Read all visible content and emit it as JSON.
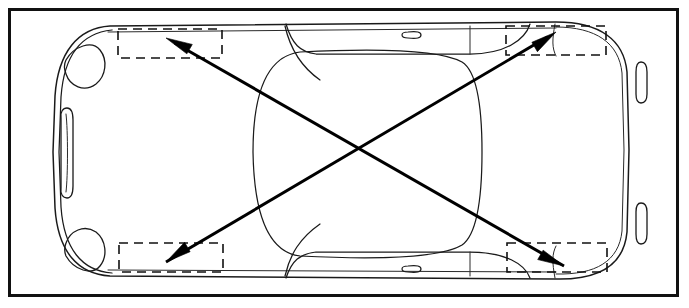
{
  "figure": {
    "title": "Vehicle body top view with diagonal measurement check",
    "view": "top-plan",
    "orientation": "front-at-left, rear-at-right",
    "background_color": "#ffffff",
    "line_color": "#1a1a1a",
    "arrow_color": "#000000",
    "dash_color": "#111111",
    "frame": {
      "name": "outer-border",
      "stroke_color": "#111111",
      "stroke_width": 3,
      "x": 8,
      "y": 8,
      "width": 671,
      "height": 289
    },
    "canvas": {
      "width": 689,
      "height": 308
    }
  },
  "vehicle": {
    "label": "car-body-outline",
    "parts": [
      {
        "name": "front-bumper",
        "side": "left"
      },
      {
        "name": "rear-bumper",
        "side": "right"
      },
      {
        "name": "left-headlamp",
        "position": "front-upper"
      },
      {
        "name": "right-headlamp",
        "position": "front-lower"
      },
      {
        "name": "grille-opening",
        "position": "front-center"
      },
      {
        "name": "upper-taillamp",
        "position": "rear-upper"
      },
      {
        "name": "lower-taillamp",
        "position": "rear-lower"
      },
      {
        "name": "roof-panel",
        "position": "center"
      },
      {
        "name": "cabin-greenhouse",
        "position": "center"
      },
      {
        "name": "upper-door-handle",
        "position": "upper-side"
      },
      {
        "name": "lower-door-handle",
        "position": "lower-side"
      }
    ]
  },
  "measurement_targets": [
    {
      "id": "target-front-left",
      "label": "front-left-reference-zone",
      "corner": "top-left",
      "x": 118,
      "y": 29,
      "width": 104,
      "height": 29
    },
    {
      "id": "target-rear-left",
      "label": "rear-left-reference-zone",
      "corner": "top-right",
      "x": 506,
      "y": 26,
      "width": 100,
      "height": 29
    },
    {
      "id": "target-front-right",
      "label": "front-right-reference-zone",
      "corner": "bottom-left",
      "x": 119,
      "y": 243,
      "width": 104,
      "height": 29
    },
    {
      "id": "target-rear-right",
      "label": "rear-right-reference-zone",
      "corner": "bottom-right",
      "x": 507,
      "y": 243,
      "width": 100,
      "height": 29
    }
  ],
  "diagonals": [
    {
      "id": "diagonal-a",
      "label": "diagonal-rear-right-to-front-left",
      "from": {
        "x": 564,
        "y": 266
      },
      "to": {
        "x": 166,
        "y": 38
      },
      "arrow_at": "to",
      "stroke_width": 3,
      "color": "#000000"
    },
    {
      "id": "diagonal-b",
      "label": "diagonal-front-left-to-rear-right",
      "from": {
        "x": 166,
        "y": 262
      },
      "to": {
        "x": 556,
        "y": 32
      },
      "arrow_at": "to",
      "stroke_width": 3,
      "color": "#000000"
    },
    {
      "id": "diagonal-c",
      "label": "diagonal-rear-left-to-front-right",
      "from": {
        "x": 556,
        "y": 32
      },
      "to": {
        "x": 166,
        "y": 262
      },
      "arrow_at": "to",
      "stroke_width": 3,
      "color": "#000000"
    },
    {
      "id": "diagonal-d",
      "label": "diagonal-front-right-to-rear-left",
      "from": {
        "x": 166,
        "y": 38
      },
      "to": {
        "x": 564,
        "y": 266
      },
      "arrow_at": "to",
      "stroke_width": 3,
      "color": "#000000"
    }
  ],
  "crossing_point": {
    "x": 361,
    "y": 151
  }
}
